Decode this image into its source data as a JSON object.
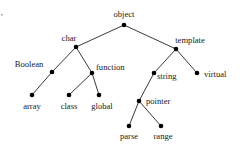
{
  "diagram": {
    "type": "tree",
    "root": "object",
    "colors": {
      "edge": "#222222",
      "node": "#000000",
      "label": "#1a1a1a",
      "background": "#ffffff"
    },
    "nodes": [
      {
        "id": "object",
        "label": "object",
        "x": 124,
        "y": 25,
        "lx": 124,
        "ly": 17,
        "anchor": "middle"
      },
      {
        "id": "char",
        "label": "char",
        "x": 76,
        "y": 47,
        "lx": 69,
        "ly": 41,
        "anchor": "middle"
      },
      {
        "id": "template",
        "label": "template",
        "x": 176,
        "y": 49,
        "lx": 190,
        "ly": 43,
        "anchor": "middle"
      },
      {
        "id": "Boolean",
        "label": "Boolean",
        "x": 52,
        "y": 72,
        "lx": 29,
        "ly": 67,
        "anchor": "middle"
      },
      {
        "id": "function",
        "label": "function",
        "x": 92,
        "y": 73,
        "lx": 96,
        "ly": 70,
        "anchor": "start"
      },
      {
        "id": "string",
        "label": "string",
        "x": 154,
        "y": 73,
        "lx": 157,
        "ly": 79,
        "anchor": "start"
      },
      {
        "id": "virtual",
        "label": "virtual",
        "x": 197,
        "y": 73,
        "lx": 204,
        "ly": 77,
        "anchor": "start"
      },
      {
        "id": "array",
        "label": "array",
        "x": 32,
        "y": 95,
        "lx": 32,
        "ly": 109,
        "anchor": "middle"
      },
      {
        "id": "class",
        "label": "class",
        "x": 69,
        "y": 95,
        "lx": 69,
        "ly": 109,
        "anchor": "middle"
      },
      {
        "id": "global",
        "label": "global",
        "x": 99,
        "y": 95,
        "lx": 102,
        "ly": 109,
        "anchor": "middle"
      },
      {
        "id": "pointer",
        "label": "pointer",
        "x": 139,
        "y": 101,
        "lx": 146,
        "ly": 104,
        "anchor": "start"
      },
      {
        "id": "parse",
        "label": "parse",
        "x": 129,
        "y": 126,
        "lx": 129,
        "ly": 139,
        "anchor": "middle"
      },
      {
        "id": "range",
        "label": "range",
        "x": 161,
        "y": 126,
        "lx": 163,
        "ly": 139,
        "anchor": "middle"
      }
    ],
    "edges": [
      [
        "object",
        "char"
      ],
      [
        "object",
        "template"
      ],
      [
        "char",
        "Boolean"
      ],
      [
        "char",
        "function"
      ],
      [
        "Boolean",
        "array"
      ],
      [
        "function",
        "class"
      ],
      [
        "function",
        "global"
      ],
      [
        "template",
        "string"
      ],
      [
        "template",
        "virtual"
      ],
      [
        "string",
        "pointer"
      ],
      [
        "pointer",
        "parse"
      ],
      [
        "pointer",
        "range"
      ]
    ]
  }
}
